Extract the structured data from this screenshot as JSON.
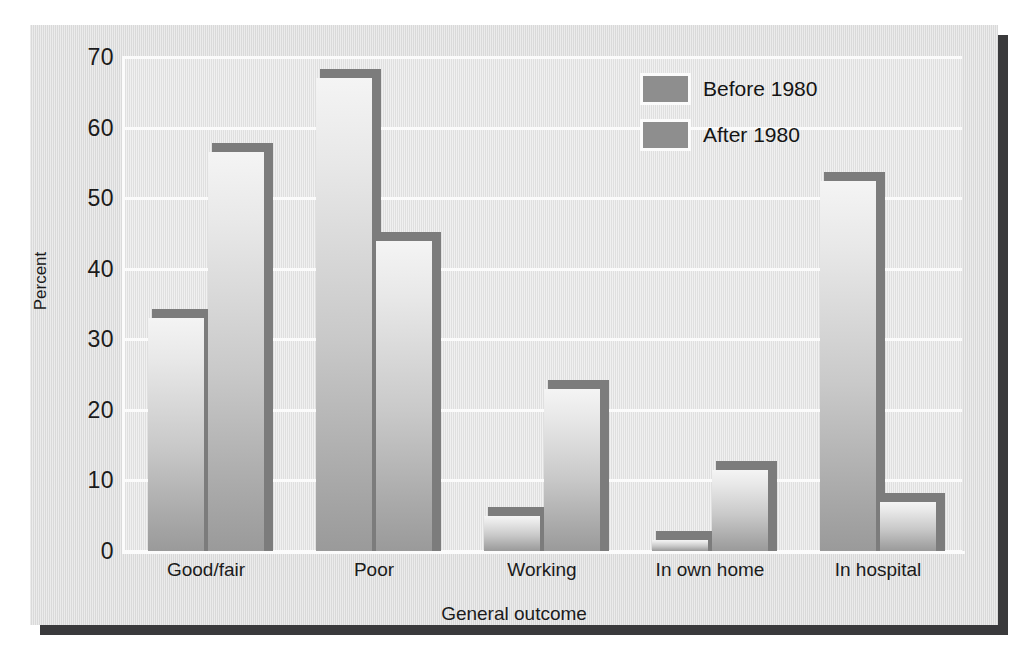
{
  "chart_data": {
    "type": "bar",
    "title": "",
    "xlabel": "General outcome",
    "ylabel": "Percent",
    "categories": [
      "Good/fair",
      "Poor",
      "Working",
      "In own home",
      "In hospital"
    ],
    "series": [
      {
        "name": "Before 1980",
        "values": [
          33,
          67,
          5,
          1.5,
          52.5
        ]
      },
      {
        "name": "After 1980",
        "values": [
          56.5,
          44,
          23,
          11.5,
          7
        ]
      }
    ],
    "ylim": [
      0,
      70
    ],
    "yticks": [
      0,
      10,
      20,
      30,
      40,
      50,
      60,
      70
    ],
    "ytick_labels": [
      "0",
      "10",
      "20",
      "30",
      "40",
      "50",
      "60",
      "70"
    ],
    "grid": true,
    "legend_position": "top-right",
    "colors": {
      "bar_light": "#f4f4f4",
      "bar_dark": "#9a9a9a",
      "bar_edge": "#7c7c7c",
      "legend_swatch": "#8e8e8e",
      "panel_background": "#dcdcdc",
      "plot_background": "#e2e2e2",
      "gridline": "#fbfbfb",
      "text": "#1b1b1b",
      "shadow": "#3a3a3c"
    }
  },
  "legend": {
    "items": [
      {
        "label": "Before 1980"
      },
      {
        "label": "After 1980"
      }
    ]
  },
  "axes": {
    "y_title": "Percent",
    "x_title": "General outcome"
  }
}
